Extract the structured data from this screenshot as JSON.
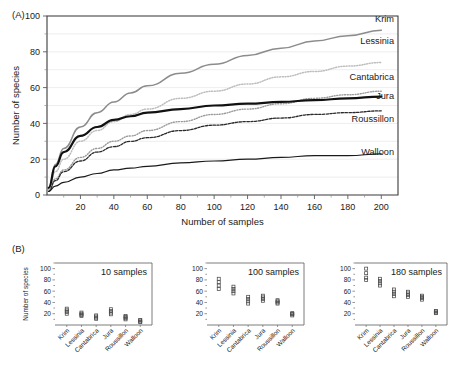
{
  "panels": {
    "a_tag": "(A)",
    "b_tag": "(B)"
  },
  "chart_data": [
    {
      "type": "line",
      "panel": "A",
      "title": "",
      "xlabel": "Number of samples",
      "ylabel": "Number of species",
      "xlim": [
        0,
        210
      ],
      "ylim": [
        0,
        100
      ],
      "xticks": [
        20,
        40,
        60,
        80,
        100,
        120,
        140,
        160,
        180,
        200
      ],
      "yticks": [
        0,
        20,
        40,
        60,
        80,
        100
      ],
      "yticks_minor": [
        10,
        30,
        50,
        70,
        90
      ],
      "grid": "horizontal",
      "legend_position": "inline-right",
      "series": [
        {
          "name": "Krim",
          "color": "#8c8c8c",
          "style": "solid",
          "width": 1.5,
          "x": [
            1,
            5,
            10,
            20,
            30,
            40,
            50,
            60,
            80,
            100,
            120,
            140,
            160,
            180,
            200
          ],
          "y": [
            4,
            17,
            26,
            38,
            46,
            52,
            57,
            61,
            68,
            73,
            78,
            82,
            86,
            89,
            92
          ]
        },
        {
          "name": "Lessinia",
          "color": "#bdbdbd",
          "style": "dotted",
          "width": 1.5,
          "x": [
            1,
            5,
            10,
            20,
            30,
            40,
            50,
            60,
            80,
            100,
            120,
            140,
            160,
            180,
            200
          ],
          "y": [
            3,
            13,
            20,
            30,
            36,
            41,
            45,
            48,
            54,
            58,
            62,
            66,
            69,
            72,
            74
          ]
        },
        {
          "name": "Cantabrica",
          "color": "#9a9a9a",
          "style": "dotted",
          "width": 1.4,
          "x": [
            1,
            5,
            10,
            20,
            30,
            40,
            50,
            60,
            80,
            100,
            120,
            140,
            160,
            180,
            200
          ],
          "y": [
            2,
            9,
            14,
            21,
            26,
            30,
            33,
            36,
            41,
            45,
            48,
            51,
            54,
            56,
            58
          ]
        },
        {
          "name": "Jura",
          "color": "#111111",
          "style": "solid",
          "width": 2.2,
          "x": [
            1,
            5,
            10,
            20,
            30,
            40,
            50,
            60,
            80,
            100,
            120,
            140,
            160,
            180,
            200
          ],
          "y": [
            4,
            16,
            24,
            33,
            38,
            42,
            44,
            46,
            48,
            50,
            51,
            52,
            53,
            54,
            55
          ]
        },
        {
          "name": "Roussillon",
          "color": "#2b2b2b",
          "style": "dashed",
          "width": 1.3,
          "x": [
            1,
            5,
            10,
            20,
            30,
            40,
            50,
            60,
            80,
            100,
            120,
            140,
            160,
            180,
            200
          ],
          "y": [
            2,
            8,
            13,
            19,
            24,
            27,
            30,
            32,
            36,
            39,
            41,
            43,
            45,
            46,
            47
          ]
        },
        {
          "name": "Walloon",
          "color": "#1a1a1a",
          "style": "solid",
          "width": 1.2,
          "x": [
            1,
            5,
            10,
            20,
            30,
            40,
            50,
            60,
            80,
            100,
            120,
            140,
            160,
            180,
            200
          ],
          "y": [
            2,
            5,
            7,
            10,
            12,
            14,
            15,
            16,
            18,
            19,
            20,
            21,
            22,
            22,
            23
          ]
        }
      ]
    },
    {
      "type": "scatter",
      "panel": "B1",
      "title": "10 samples",
      "xlabel": "",
      "ylabel": "Number of species",
      "ylim": [
        0,
        110
      ],
      "yticks": [
        20,
        40,
        60,
        80,
        100
      ],
      "categories": [
        "Krim",
        "Lessinia",
        "Cantabrica",
        "Jura",
        "Roussillon",
        "Walloon"
      ],
      "values": [
        [
          20,
          23,
          26,
          29
        ],
        [
          16,
          18,
          20,
          22
        ],
        [
          11,
          13,
          15,
          17
        ],
        [
          19,
          22,
          25,
          28
        ],
        [
          10,
          12,
          14,
          16
        ],
        [
          5,
          6,
          8,
          9
        ]
      ]
    },
    {
      "type": "scatter",
      "panel": "B2",
      "title": "100 samples",
      "xlabel": "",
      "ylabel": "",
      "ylim": [
        0,
        110
      ],
      "yticks": [
        20,
        40,
        60,
        80,
        100
      ],
      "categories": [
        "Krim",
        "Lessinia",
        "Cantabrica",
        "Jura",
        "Roussillon",
        "Walloon"
      ],
      "values": [
        [
          64,
          70,
          76,
          82
        ],
        [
          56,
          60,
          64,
          68
        ],
        [
          38,
          42,
          46,
          50
        ],
        [
          43,
          46,
          49,
          52
        ],
        [
          38,
          40,
          42,
          44
        ],
        [
          17,
          19,
          20,
          21
        ]
      ]
    },
    {
      "type": "scatter",
      "panel": "B3",
      "title": "180 samples",
      "xlabel": "",
      "ylabel": "",
      "ylim": [
        0,
        110
      ],
      "yticks": [
        20,
        40,
        60,
        80,
        100
      ],
      "categories": [
        "Krim",
        "Lessinia",
        "Cantabrica",
        "Jura",
        "Roussillon",
        "Walloon"
      ],
      "values": [
        [
          80,
          84,
          92,
          100
        ],
        [
          70,
          74,
          78,
          82
        ],
        [
          51,
          55,
          59,
          63
        ],
        [
          50,
          53,
          56,
          59
        ],
        [
          45,
          48,
          50,
          52
        ],
        [
          21,
          22,
          24,
          25
        ]
      ]
    }
  ]
}
